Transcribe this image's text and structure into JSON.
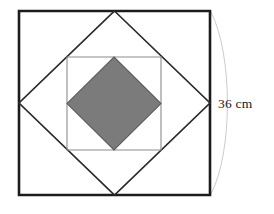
{
  "figure": {
    "canvas": {
      "width": 274,
      "height": 214,
      "background": "#ffffff"
    },
    "dimension": {
      "label": "36 cm",
      "value": 36,
      "unit": "cm",
      "applies_to": "outer-square-side",
      "leader_style": "curved-brace-arc",
      "leader_color": "#c9c9c9",
      "label_color": "#1a1a1a"
    },
    "shapes": [
      {
        "name": "outer-square",
        "kind": "square",
        "orientation": "axis-aligned",
        "stroke": "#1c1c1c",
        "stroke_width": 2.6,
        "fill": "none",
        "points": "19,11 210,11 210,195 19,195"
      },
      {
        "name": "large-diamond",
        "kind": "square",
        "orientation": "rotated-45",
        "stroke": "#2b2b2b",
        "stroke_width": 1.7,
        "fill": "none",
        "points": "114.5,11 210,103 114.5,195 19,103",
        "note": "vertices at midpoints of outer-square sides"
      },
      {
        "name": "middle-square",
        "kind": "square",
        "orientation": "axis-aligned",
        "stroke": "#8c8c8c",
        "stroke_width": 1.1,
        "fill": "none",
        "points": "67,57 161,57 161,150 67,150"
      },
      {
        "name": "shaded-diamond",
        "kind": "square",
        "orientation": "rotated-45",
        "stroke": "#5e5e5e",
        "stroke_width": 1.1,
        "fill": "#7b7b7b",
        "points": "114,57 161,103.5 114,150 67,103.5",
        "note": "vertices at midpoints of middle-square sides; shaded region"
      }
    ],
    "arc": {
      "name": "dimension-arc",
      "path": "M 211 12 C 233 55 233 152 211 194",
      "stroke": "#cccccc",
      "stroke_width": 1.0,
      "fill": "none"
    },
    "label_position": {
      "x": 218,
      "y": 108
    }
  }
}
